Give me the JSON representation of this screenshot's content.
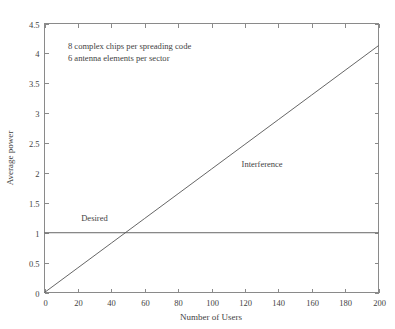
{
  "chart_data": {
    "type": "line",
    "title": "",
    "xlabel": "Number of Users",
    "ylabel": "Average power",
    "xlim": [
      0,
      200
    ],
    "ylim": [
      0,
      4.5
    ],
    "grid": false,
    "legend_position": "inline-labels",
    "xticks": [
      0,
      20,
      40,
      60,
      80,
      100,
      120,
      140,
      160,
      180,
      200
    ],
    "xtick_labels": [
      "0",
      "20",
      "40",
      "60",
      "80",
      "100",
      "120",
      "140",
      "160",
      "180",
      "200"
    ],
    "yticks": [
      0,
      0.5,
      1,
      1.5,
      2,
      2.5,
      3,
      3.5,
      4,
      4.5
    ],
    "ytick_labels": [
      "0",
      "0.5",
      "1",
      "1.5",
      "2",
      "2.5",
      "3",
      "3.5",
      "4",
      "4.5"
    ],
    "series": [
      {
        "name": "Interference",
        "x": [
          0,
          20,
          40,
          60,
          80,
          100,
          120,
          140,
          160,
          180,
          200
        ],
        "values": [
          0,
          0.413,
          0.826,
          1.239,
          1.652,
          2.065,
          2.478,
          2.891,
          3.304,
          3.717,
          4.13
        ],
        "label_x": 118,
        "label_y": 2.1
      },
      {
        "name": "Desired",
        "x": [
          0,
          200
        ],
        "values": [
          1,
          1
        ],
        "label_x": 22,
        "label_y": 1.19
      }
    ],
    "annotations": [
      {
        "text": "8 complex chips per spreading code",
        "x": 14,
        "y": 4.07
      },
      {
        "text": "6 antenna elements per sector",
        "x": 14,
        "y": 3.87
      }
    ]
  },
  "colors": {
    "background": "#ffffff",
    "axis": "#8a8a8a",
    "line": "#555555",
    "text": "#3f3f3f"
  }
}
